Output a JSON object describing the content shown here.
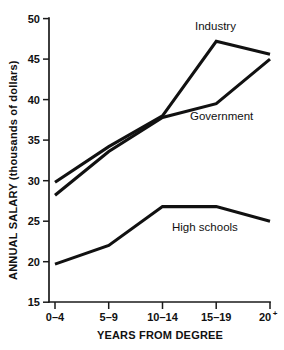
{
  "chart_data": {
    "type": "line",
    "title": "",
    "xlabel": "YEARS FROM DEGREE",
    "ylabel": "ANNUAL SALARY (thousands of dollars)",
    "categories": [
      "0–4",
      "5–9",
      "10–14",
      "15–19",
      "20⁺"
    ],
    "ylim": [
      15,
      50
    ],
    "yticks": [
      15,
      20,
      25,
      30,
      35,
      40,
      45,
      50
    ],
    "ytick_labels": [
      "15",
      "20",
      "25",
      "30",
      "35",
      "40",
      "45",
      "50"
    ],
    "grid": false,
    "legend": "inline-labels",
    "series": [
      {
        "name": "Industry",
        "values": [
          29.8,
          34.2,
          38.0,
          47.2,
          45.6
        ]
      },
      {
        "name": "Government",
        "values": [
          28.2,
          33.6,
          37.8,
          39.5,
          45.0
        ]
      },
      {
        "name": "High schools",
        "values": [
          19.7,
          22.0,
          26.8,
          26.8,
          25.0
        ]
      }
    ],
    "annotations": [
      {
        "text": "Industry",
        "series": "Industry",
        "x": 195,
        "y": 30
      },
      {
        "text": "Government",
        "series": "Government",
        "x": 190,
        "y": 120
      },
      {
        "text": "High schools",
        "series": "High schools",
        "x": 172,
        "y": 231
      }
    ]
  },
  "axis": {
    "x_title": "YEARS FROM DEGREE",
    "y_title": "ANNUAL SALARY (thousands of dollars)",
    "y_ticks": [
      "50",
      "45",
      "40",
      "35",
      "30",
      "25",
      "20",
      "15"
    ],
    "x_ticks": [
      "0–4",
      "5–9",
      "10–14",
      "15–19",
      "20"
    ],
    "x_last_superscript": "+"
  }
}
